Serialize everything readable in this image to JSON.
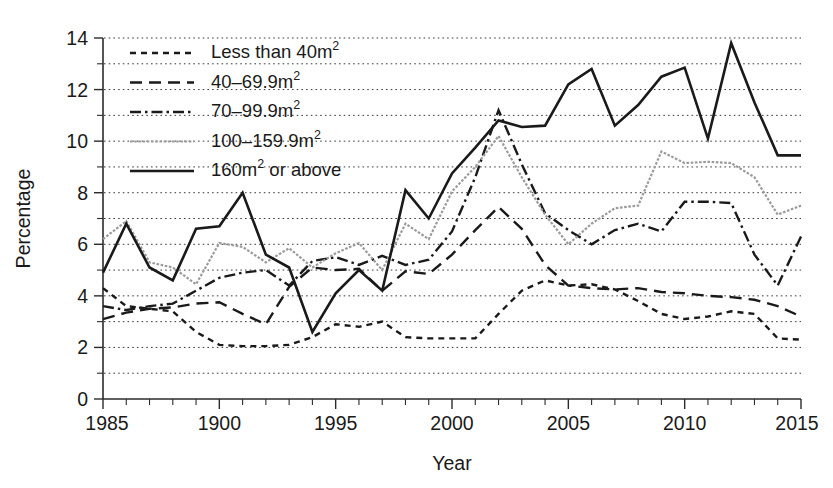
{
  "chart_data": {
    "type": "line",
    "title": "",
    "xlabel": "Year",
    "ylabel": "Percentage",
    "xlim": [
      1985,
      2015
    ],
    "ylim": [
      0,
      14
    ],
    "grid": true,
    "legend_position": "top-left",
    "x_tick_labels": [
      "1985",
      "1900",
      "1995",
      "2000",
      "2005",
      "2010",
      "2015"
    ],
    "x_tick_values": [
      1985,
      1990,
      1995,
      2000,
      2005,
      2010,
      2015
    ],
    "y_tick_labels": [
      "0",
      "2",
      "4",
      "6",
      "8",
      "10",
      "12",
      "14"
    ],
    "y_tick_values": [
      0,
      2,
      4,
      6,
      8,
      10,
      12,
      14
    ],
    "y_minor_tick_values": [
      1,
      3,
      5,
      7,
      9,
      11,
      13
    ],
    "x": [
      1985,
      1986,
      1987,
      1988,
      1989,
      1990,
      1991,
      1992,
      1993,
      1994,
      1995,
      1996,
      1997,
      1998,
      1999,
      2000,
      2001,
      2002,
      2003,
      2004,
      2005,
      2006,
      2007,
      2008,
      2009,
      2010,
      2011,
      2012,
      2013,
      2014,
      2015
    ],
    "series": [
      {
        "name": "Less than 40m2",
        "legend_text": "Less than 40m",
        "legend_sup": "2",
        "style": "dotted",
        "color": "#1a1a1a",
        "values": [
          4.3,
          3.6,
          3.5,
          3.4,
          2.6,
          2.1,
          2.05,
          2.05,
          2.1,
          2.4,
          2.9,
          2.8,
          3.0,
          2.4,
          2.35,
          2.35,
          2.35,
          3.3,
          4.2,
          4.6,
          4.4,
          4.45,
          4.25,
          3.8,
          3.3,
          3.1,
          3.2,
          3.4,
          3.3,
          2.35,
          2.3
        ]
      },
      {
        "name": "40-69.9m2",
        "legend_text": "40–69.9m",
        "legend_sup": "2",
        "style": "dashed",
        "color": "#1a1a1a",
        "values": [
          3.1,
          3.35,
          3.5,
          3.55,
          3.7,
          3.75,
          3.3,
          2.9,
          4.35,
          5.1,
          5.0,
          5.05,
          4.2,
          4.95,
          4.85,
          5.6,
          6.55,
          7.45,
          6.6,
          5.2,
          4.4,
          4.3,
          4.25,
          4.3,
          4.15,
          4.1,
          4.0,
          3.95,
          3.85,
          3.6,
          3.2
        ]
      },
      {
        "name": "70-99.9m2",
        "legend_text": "70–99.9m",
        "legend_sup": "2",
        "style": "dashdot",
        "color": "#1a1a1a",
        "values": [
          3.6,
          3.45,
          3.6,
          3.7,
          4.2,
          4.7,
          4.9,
          5.0,
          4.4,
          5.35,
          5.5,
          5.2,
          5.55,
          5.2,
          5.4,
          6.5,
          8.6,
          11.2,
          9.1,
          7.2,
          6.55,
          6.0,
          6.55,
          6.8,
          6.5,
          7.65,
          7.65,
          7.6,
          5.6,
          4.4,
          6.3
        ]
      },
      {
        "name": "100-159.9m2",
        "legend_text": "100–159.9m",
        "legend_sup": "2",
        "style": "fine-dotted-gray",
        "color": "#9b9b9b",
        "values": [
          6.2,
          6.9,
          5.3,
          5.1,
          4.45,
          6.05,
          5.9,
          5.3,
          5.85,
          5.1,
          5.65,
          6.05,
          5.0,
          6.8,
          6.2,
          8.05,
          9.0,
          10.2,
          8.6,
          7.15,
          6.0,
          6.8,
          7.4,
          7.5,
          9.6,
          9.15,
          9.2,
          9.15,
          8.6,
          7.15,
          7.5
        ]
      },
      {
        "name": "160m2 or above",
        "legend_text": "160m",
        "legend_sup": "2",
        "legend_text_after": " or above",
        "style": "solid",
        "color": "#1a1a1a",
        "values": [
          4.9,
          6.8,
          5.1,
          4.6,
          6.6,
          6.7,
          8.0,
          5.6,
          5.1,
          2.6,
          4.1,
          5.0,
          4.2,
          8.1,
          7.0,
          8.75,
          9.75,
          10.8,
          10.55,
          10.6,
          12.2,
          12.8,
          10.6,
          11.4,
          12.5,
          12.85,
          10.1,
          13.8,
          11.5,
          9.45,
          9.45
        ]
      }
    ]
  },
  "legend": {
    "items": [
      {
        "swatch": "dotted",
        "label": "Less than 40m",
        "sup": "2",
        "suffix": ""
      },
      {
        "swatch": "dashed",
        "label": "40–69.9m",
        "sup": "2",
        "suffix": ""
      },
      {
        "swatch": "dashdot",
        "label": "70–99.9m",
        "sup": "2",
        "suffix": ""
      },
      {
        "swatch": "fine-dotted-gray",
        "label": "100–159.9m",
        "sup": "2",
        "suffix": ""
      },
      {
        "swatch": "solid",
        "label": "160m",
        "sup": "2",
        "suffix": " or above"
      }
    ]
  }
}
